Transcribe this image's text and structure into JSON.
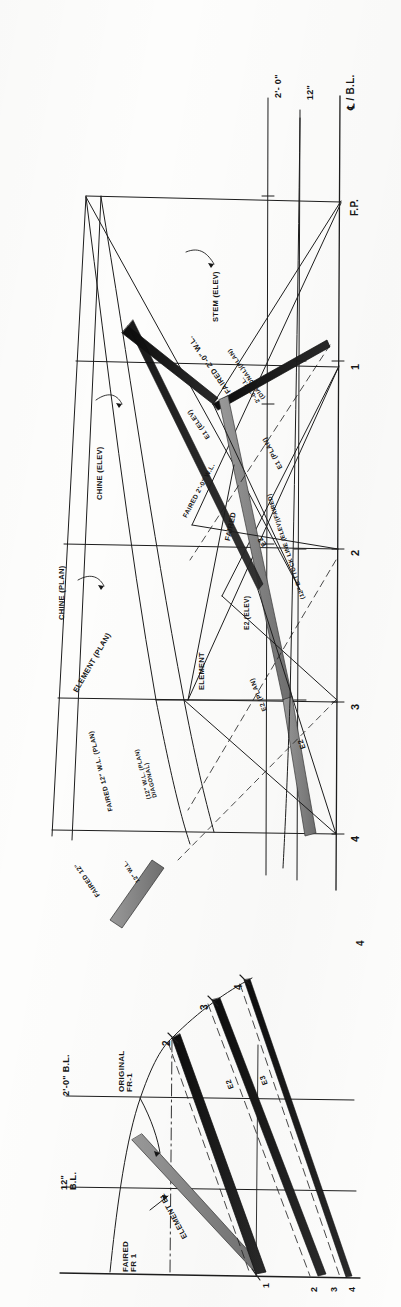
{
  "document": {
    "kind": "naval-architecture-lines-plan",
    "orientation_note": "drawing-rotated-90-ccw",
    "sheet_width": 401,
    "sheet_height": 1307
  },
  "colors": {
    "ink": "#161616",
    "line": "#1d1d1d",
    "hatch_dark": "#101010",
    "hatch_light": "#8e8e8e",
    "paper": "#fdfdfc"
  },
  "reference_lines": {
    "waterline_2ft": "2'- 0\"",
    "waterline_12in": "12\"",
    "baseline": "℄ / B.L.",
    "forward_perpendicular": "F.P."
  },
  "stations": {
    "plan_profile": [
      "1",
      "2",
      "3",
      "4"
    ],
    "body_plan_top": [
      "2",
      "3",
      "4"
    ],
    "body_plan_bottom": [
      "1",
      "2",
      "3",
      "4"
    ]
  },
  "annotations": {
    "stem_elev": "STEM (ELEV)",
    "chine_elev": "CHINE (ELEV)",
    "chine_plan": "CHINE (PLAN)",
    "faired_2_0_wl": "FAIRED 2'-0\" W.L.",
    "wl_2_0_diagonal_plan_line1": "2'-0\" W.L.",
    "wl_2_0_diagonal_plan_line2": "(DIAGONAL)(PLAN)",
    "e1_elev": "E1 (ELEV)",
    "e1_plan": "E1 (PLAN)",
    "e2": "E2",
    "e2_elev": "E2 (ELEV)",
    "e2_plan": "E2 (PLAN)",
    "faired": "FAIRED",
    "faired_12_wl_plan": "FAIRED 12\" W.L. (PLAN)",
    "wl_12_diagonal_plan_line1": "(12\" W.L. (PLAN)",
    "wl_12_diagonal_plan_line2": "DIAGONAL)",
    "element_plan": "ELEMENT (PLAN)",
    "element": "ELEMENT",
    "buttock_12_elev_faired": "(12\" B-TTOCK LINE (ELEV)(FAIRED)",
    "faired_12_partial": "FAIRED 12\"",
    "wl_12_partial": "12\" W.L."
  },
  "body_plan": {
    "bl_2_0": "2'-0\" B.L.",
    "bl_12_line1": "12\"",
    "bl_12_line2": "B.L.",
    "original_fr_line1": "ORIGINAL",
    "original_fr_line2": "FR-1",
    "faired_fr_line1": "FAIRED",
    "faired_fr_line2": "FR 1",
    "element_e1": "ELEMENT  E1",
    "element_e2": "E2",
    "element_e3": "E3",
    "station_marks": [
      "2",
      "3",
      "4"
    ]
  }
}
